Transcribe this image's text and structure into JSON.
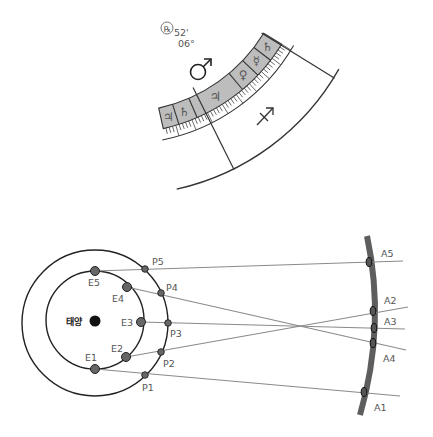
{
  "top_figure": {
    "retrograde_symbol": "℞",
    "minutes_label": "52'",
    "degrees_label": "06°",
    "mars_symbol": "♂",
    "sagittarius_symbol": "♐",
    "band_tiles": [
      {
        "symbol": "♃",
        "name": "jupiter"
      },
      {
        "symbol": "♄",
        "name": "saturn"
      },
      {
        "symbol": "♃",
        "name": "jupiter"
      },
      {
        "symbol": "♀",
        "name": "venus"
      },
      {
        "symbol": "☿",
        "name": "mercury"
      },
      {
        "symbol": "♄",
        "name": "saturn"
      }
    ],
    "colors": {
      "band": "#bdbdbd",
      "line": "#333333"
    }
  },
  "bottom_figure": {
    "sun_label": "태양",
    "earth_labels": [
      "E1",
      "E2",
      "E3",
      "E4",
      "E5"
    ],
    "planet_labels": [
      "P1",
      "P2",
      "P3",
      "P4",
      "P5"
    ],
    "apparent_labels": [
      "A1",
      "A2",
      "A3",
      "A4",
      "A5"
    ],
    "colors": {
      "dot": "#666666",
      "line": "#8a8a8a",
      "arc": "#5a5a5a",
      "orbit": "#222222"
    }
  }
}
